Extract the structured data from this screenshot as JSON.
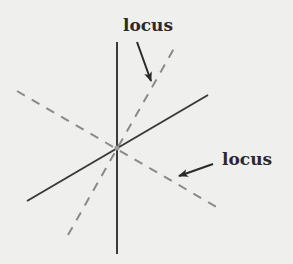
{
  "figure": {
    "background": "#efefee",
    "solid_color": "#3a3a3a",
    "dashed_color": "#8a8a8a",
    "labels": [
      {
        "id": "top",
        "text": "locus"
      },
      {
        "id": "right",
        "text": "locus"
      }
    ]
  },
  "lines": {
    "vertical": {
      "x1": 117,
      "y1": 42,
      "x2": 117,
      "y2": 254
    },
    "solid_diagonal": {
      "x1": 27,
      "y1": 201,
      "x2": 208,
      "y2": 95
    },
    "dashed_steep": {
      "x1": 68,
      "y1": 235,
      "x2": 176,
      "y2": 45
    },
    "dashed_shallow": {
      "x1": 17,
      "y1": 91,
      "x2": 220,
      "y2": 209
    }
  },
  "center": {
    "x": 117,
    "y": 148
  }
}
